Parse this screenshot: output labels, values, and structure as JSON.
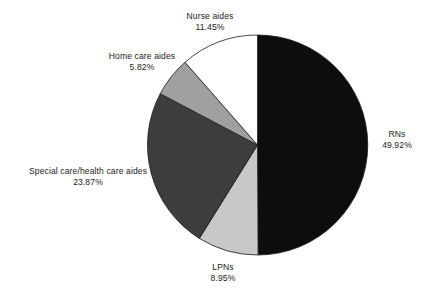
{
  "figure": {
    "background_color": "#ffffff",
    "text_color": "#1b1b1b"
  },
  "chart_data": {
    "type": "pie",
    "title": "",
    "subtitle": "",
    "xlabel": "",
    "ylabel": "",
    "legend_position": "none",
    "grid": false,
    "value_unit": "percent",
    "start_angle_deg": 90,
    "direction": "clockwise",
    "categories": [
      "RNs",
      "LPNs",
      "Special care/health care aides",
      "Home care aides",
      "Nurse aides"
    ],
    "values": [
      49.92,
      8.95,
      23.87,
      5.82,
      11.45
    ],
    "value_labels": [
      "49.92%",
      "8.95%",
      "23.87%",
      "5.82%",
      "11.45%"
    ],
    "colors": [
      "#0d0d0d",
      "#c8c8c8",
      "#3d3d3d",
      "#a0a0a0",
      "#ffffff"
    ],
    "slice_edge_color": "#1b1b1b",
    "slices": [
      {
        "name": "RNs",
        "value": 49.92,
        "value_label": "49.92%",
        "color": "#0d0d0d",
        "label_position": "right"
      },
      {
        "name": "LPNs",
        "value": 8.95,
        "value_label": "8.95%",
        "color": "#c8c8c8",
        "label_position": "bottom"
      },
      {
        "name": "Special care/health care aides",
        "value": 23.87,
        "value_label": "23.87%",
        "color": "#3d3d3d",
        "label_position": "left"
      },
      {
        "name": "Home care aides",
        "value": 5.82,
        "value_label": "5.82%",
        "color": "#a0a0a0",
        "label_position": "upper-left"
      },
      {
        "name": "Nurse aides",
        "value": 11.45,
        "value_label": "11.45%",
        "color": "#ffffff",
        "label_position": "top"
      }
    ]
  }
}
